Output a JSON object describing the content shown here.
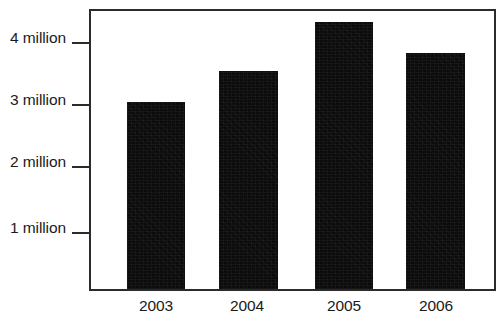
{
  "chart_data": {
    "type": "bar",
    "title": "",
    "subtitle": "",
    "xlabel": "",
    "ylabel": "",
    "categories": [
      "2003",
      "2004",
      "2005",
      "2006"
    ],
    "values": [
      3.0,
      3.5,
      4.3,
      3.8
    ],
    "ylim": [
      0,
      4.47
    ],
    "ytick_values": [
      1,
      2,
      3,
      4
    ],
    "ytick_labels": [
      "1 million",
      "2 million",
      "3 million",
      "4 million"
    ],
    "grid": false,
    "legend": null,
    "series": [
      {
        "name": "",
        "values": [
          3.0,
          3.5,
          4.3,
          3.8
        ]
      }
    ],
    "annotations": [],
    "colors": {
      "bar": "#0b0b0b",
      "axis": "#2b2b2b",
      "text": "#1a1a1a",
      "background": "#ffffff"
    }
  },
  "axes": {
    "y_ticks": [
      {
        "label": "4 million",
        "value": 4
      },
      {
        "label": "3 million",
        "value": 3
      },
      {
        "label": "2 million",
        "value": 2
      },
      {
        "label": "1 million",
        "value": 1
      }
    ],
    "x_ticks": [
      {
        "label": "2003"
      },
      {
        "label": "2004"
      },
      {
        "label": "2005"
      },
      {
        "label": "2006"
      }
    ]
  }
}
